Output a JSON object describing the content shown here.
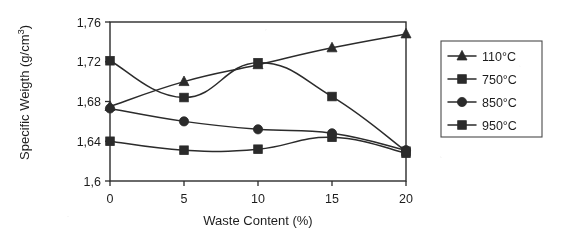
{
  "chart_data": {
    "type": "line",
    "title": "",
    "xlabel": "Waste Content (%)",
    "ylabel": "Specific Weigth (g/cm 3)",
    "ylabel_text": "Specific Weigth (g/cm",
    "ylabel_sup": "3",
    "ylabel_tail": ")",
    "x": [
      0,
      5,
      10,
      15,
      20
    ],
    "xtick_labels": [
      "0",
      "5",
      "10",
      "15",
      "20"
    ],
    "ytick_labels": [
      "1,6",
      "1,64",
      "1,68",
      "1,72",
      "1,76"
    ],
    "ytick_values": [
      1.6,
      1.64,
      1.68,
      1.72,
      1.76
    ],
    "xlim": [
      0,
      20
    ],
    "ylim": [
      1.6,
      1.76
    ],
    "grid": false,
    "legend_position": "right-outside",
    "decimal_separator": ",",
    "series": [
      {
        "name": "110°C",
        "marker": "triangle",
        "values": [
          1.675,
          1.7,
          1.717,
          1.734,
          1.748
        ]
      },
      {
        "name": "750°C",
        "marker": "square",
        "values": [
          1.64,
          1.631,
          1.632,
          1.644,
          1.628
        ]
      },
      {
        "name": "850°C",
        "marker": "circle",
        "values": [
          1.673,
          1.66,
          1.652,
          1.648,
          1.631
        ]
      },
      {
        "name": "950°C",
        "marker": "square",
        "values": [
          1.721,
          1.684,
          1.719,
          1.685,
          1.63
        ]
      }
    ]
  },
  "legend": {
    "items": [
      {
        "label": "110°C",
        "marker": "triangle"
      },
      {
        "label": "750°C",
        "marker": "square"
      },
      {
        "label": "850°C",
        "marker": "circle"
      },
      {
        "label": "950°C",
        "marker": "square"
      }
    ]
  },
  "colors": {
    "ink": "#2b2b2b",
    "background": "#ffffff",
    "legend_border": "#4a4a4a"
  }
}
